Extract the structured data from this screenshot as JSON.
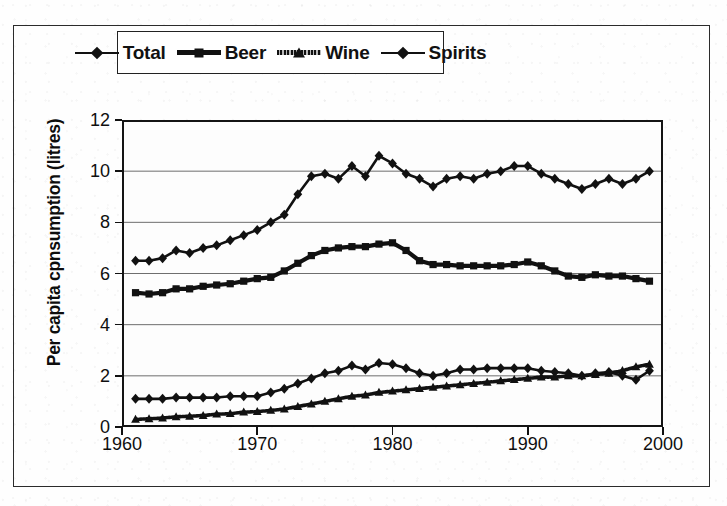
{
  "figure": {
    "y_axis_title": "Per capita cpnsumption (litres)",
    "x_axis_title": ""
  },
  "legend": {
    "position": "top-center",
    "items": [
      {
        "label": "Total",
        "marker": "diamond-marker",
        "style": "line"
      },
      {
        "label": "Beer",
        "marker": "square-marker",
        "style": "thick"
      },
      {
        "label": "Wine",
        "marker": "triangle-marker",
        "style": "hatch"
      },
      {
        "label": "Spirits",
        "marker": "diamond-marker",
        "style": "line"
      }
    ]
  },
  "axes": {
    "y_ticks": [
      "0",
      "2",
      "4",
      "6",
      "8",
      "10",
      "12"
    ],
    "x_ticks": [
      "1960",
      "1970",
      "1980",
      "1990",
      "2000"
    ],
    "xlim": [
      1960,
      2000
    ],
    "ylim": [
      0,
      12
    ]
  },
  "chart_data": {
    "type": "line",
    "title": "",
    "xlabel": "",
    "ylabel": "Per capita cpnsumption (litres)",
    "xlim": [
      1960,
      2000
    ],
    "ylim": [
      0,
      12
    ],
    "grid": "horizontal",
    "legend_position": "top-center",
    "x": [
      1961,
      1962,
      1963,
      1964,
      1965,
      1966,
      1967,
      1968,
      1969,
      1970,
      1971,
      1972,
      1973,
      1974,
      1975,
      1976,
      1977,
      1978,
      1979,
      1980,
      1981,
      1982,
      1983,
      1984,
      1985,
      1986,
      1987,
      1988,
      1989,
      1990,
      1991,
      1992,
      1993,
      1994,
      1995,
      1996,
      1997,
      1998,
      1999
    ],
    "series": [
      {
        "name": "Total",
        "marker": "diamond",
        "values": [
          6.5,
          6.5,
          6.6,
          6.9,
          6.8,
          7.0,
          7.1,
          7.3,
          7.5,
          7.7,
          8.0,
          8.3,
          9.1,
          9.8,
          9.9,
          9.7,
          10.2,
          9.8,
          10.6,
          10.3,
          9.9,
          9.7,
          9.4,
          9.7,
          9.8,
          9.7,
          9.9,
          10.0,
          10.2,
          10.2,
          9.9,
          9.7,
          9.5,
          9.3,
          9.5,
          9.7,
          9.5,
          9.7,
          10.0
        ]
      },
      {
        "name": "Beer",
        "marker": "square",
        "values": [
          5.25,
          5.2,
          5.25,
          5.4,
          5.4,
          5.5,
          5.55,
          5.6,
          5.7,
          5.8,
          5.85,
          6.1,
          6.4,
          6.7,
          6.9,
          7.0,
          7.05,
          7.05,
          7.15,
          7.2,
          6.9,
          6.5,
          6.35,
          6.35,
          6.3,
          6.3,
          6.3,
          6.3,
          6.35,
          6.45,
          6.3,
          6.1,
          5.9,
          5.85,
          5.95,
          5.9,
          5.9,
          5.8,
          5.7
        ]
      },
      {
        "name": "Wine",
        "marker": "triangle",
        "values": [
          0.3,
          0.32,
          0.35,
          0.4,
          0.42,
          0.45,
          0.5,
          0.52,
          0.58,
          0.6,
          0.65,
          0.7,
          0.8,
          0.9,
          1.0,
          1.1,
          1.2,
          1.25,
          1.35,
          1.4,
          1.45,
          1.5,
          1.55,
          1.6,
          1.65,
          1.7,
          1.75,
          1.8,
          1.85,
          1.9,
          1.95,
          1.95,
          2.0,
          2.0,
          2.05,
          2.1,
          2.2,
          2.35,
          2.45
        ]
      },
      {
        "name": "Spirits",
        "marker": "diamond",
        "values": [
          1.1,
          1.1,
          1.1,
          1.15,
          1.15,
          1.15,
          1.15,
          1.2,
          1.2,
          1.2,
          1.35,
          1.5,
          1.7,
          1.9,
          2.1,
          2.2,
          2.4,
          2.25,
          2.5,
          2.45,
          2.3,
          2.1,
          2.0,
          2.1,
          2.25,
          2.25,
          2.3,
          2.3,
          2.3,
          2.3,
          2.2,
          2.15,
          2.1,
          2.0,
          2.1,
          2.15,
          2.0,
          1.85,
          2.2
        ]
      }
    ]
  }
}
